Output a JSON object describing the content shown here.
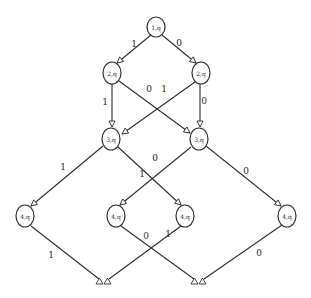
{
  "diagram": {
    "type": "binary decision diagram",
    "nodes": [
      {
        "id": "n1",
        "label": "1,q",
        "x": 156,
        "y": 27
      },
      {
        "id": "n2a",
        "label": "2,q",
        "x": 112,
        "y": 73
      },
      {
        "id": "n2b",
        "label": "2,q",
        "x": 201,
        "y": 73
      },
      {
        "id": "n3a",
        "label": "3,q",
        "x": 111,
        "y": 139
      },
      {
        "id": "n3b",
        "label": "3,q",
        "x": 199,
        "y": 139
      },
      {
        "id": "n4a",
        "label": "4,q",
        "x": 25,
        "y": 216
      },
      {
        "id": "n4b",
        "label": "4,q",
        "x": 116,
        "y": 216
      },
      {
        "id": "n4c",
        "label": "4,q",
        "x": 185,
        "y": 216
      },
      {
        "id": "n4d",
        "label": "4,q",
        "x": 287,
        "y": 216
      }
    ],
    "sinks": [
      {
        "id": "s1",
        "label": "ΔΔ",
        "x": 104,
        "y": 281
      },
      {
        "id": "s2",
        "label": "ΔΔ",
        "x": 199,
        "y": 281
      }
    ],
    "edges": [
      {
        "from": "n1",
        "to": "n2a",
        "label": "1",
        "lx": 134,
        "ly": 44
      },
      {
        "from": "n1",
        "to": "n2b",
        "label": "0",
        "lx": 179,
        "ly": 43
      },
      {
        "from": "n2a",
        "to": "n3a",
        "label": "1",
        "lx": 105,
        "ly": 102
      },
      {
        "from": "n2a",
        "to": "n3b",
        "label": "0",
        "lx": 149,
        "ly": 89
      },
      {
        "from": "n2b",
        "to": "n3a",
        "label": "1",
        "lx": 164,
        "ly": 89
      },
      {
        "from": "n2b",
        "to": "n3b",
        "label": "0",
        "lx": 204,
        "ly": 101
      },
      {
        "from": "n3a",
        "to": "n4a",
        "label": "1",
        "lx": 63,
        "ly": 167
      },
      {
        "from": "n3a",
        "to": "n4c",
        "label": "0",
        "lx": 155,
        "ly": 158
      },
      {
        "from": "n3b",
        "to": "n4b",
        "label": "1",
        "lx": 142,
        "ly": 174
      },
      {
        "from": "n3b",
        "to": "n4d",
        "label": "0",
        "lx": 246,
        "ly": 171
      },
      {
        "from": "n4a",
        "to": "s1",
        "label": "1",
        "lx": 51,
        "ly": 255
      },
      {
        "from": "n4b",
        "to": "s2",
        "label": "0",
        "lx": 146,
        "ly": 236
      },
      {
        "from": "n4c",
        "to": "s1",
        "label": "1",
        "lx": 168,
        "ly": 234
      },
      {
        "from": "n4d",
        "to": "s2",
        "label": "0",
        "lx": 259,
        "ly": 253
      }
    ]
  },
  "labels": {
    "n1": "1,q",
    "n2a": "2,q",
    "n2b": "2,q",
    "n3a": "3,q",
    "n3b": "3,q",
    "n4a": "4,q",
    "n4b": "4,q",
    "n4c": "4,q",
    "n4d": "4,q",
    "e_n1_n2a": "1",
    "e_n1_n2b": "0",
    "e_n2a_n3a": "1",
    "e_n2a_n3b": "0",
    "e_n2b_n3a": "1",
    "e_n2b_n3b": "0",
    "e_n3a_n4a": "1",
    "e_n3a_n4c": "0",
    "e_n3b_n4b": "1",
    "e_n3b_n4d": "0",
    "e_n4a_s1": "1",
    "e_n4b_s2": "0",
    "e_n4c_s1": "1",
    "e_n4d_s2": "0"
  }
}
